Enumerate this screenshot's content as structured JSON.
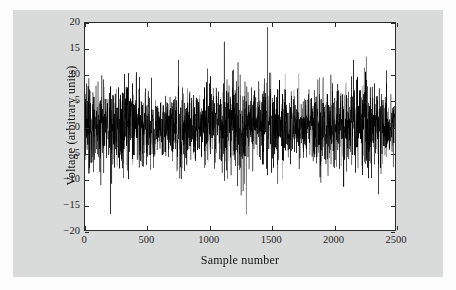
{
  "figure": {
    "background_color": "#d9dada",
    "page_color": "#fdfdfd",
    "plot_background_color": "#fefefe",
    "axis_color": "#2b2b2b",
    "trace_color": "#000000"
  },
  "chart_data": {
    "type": "line",
    "title": "",
    "subtitle": "",
    "xlabel": "Sample number",
    "ylabel": "Voltage (arbitrary units)",
    "xlim": [
      0,
      2500
    ],
    "ylim": [
      -20,
      20
    ],
    "xticks": [
      0,
      500,
      1000,
      1500,
      2000,
      2500
    ],
    "xtick_labels": [
      "0",
      "500",
      "1000",
      "1500",
      "2000",
      "2500"
    ],
    "yticks": [
      20,
      15,
      10,
      5,
      0,
      -5,
      -10,
      -15,
      -20
    ],
    "ytick_labels": [
      "20",
      "15",
      "10",
      "5",
      "0",
      "−5",
      "−10",
      "−15",
      "−20"
    ],
    "grid": false,
    "legend": null,
    "legend_position": "none",
    "annotations": [],
    "series": [
      {
        "name": "voltage",
        "description": "Random noise waveform, zero-mean, approximately Gaussian",
        "n_samples": 2500,
        "x_start": 0,
        "x_end": 2500,
        "mean": 0.0,
        "std_dev": 4.0,
        "observed_max": 19.2,
        "observed_max_at_sample": 1470,
        "observed_min": -17.0,
        "observed_min_at_sample": 1300,
        "secondary_min": -16.9,
        "secondary_min_at_sample": 205,
        "typical_envelope_upper": 12,
        "typical_envelope_lower": -12,
        "line_width": 0.5
      }
    ]
  }
}
